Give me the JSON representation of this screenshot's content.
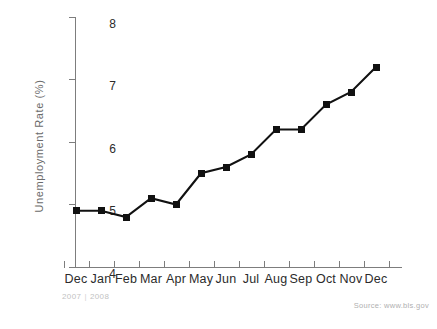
{
  "chart_data": {
    "type": "line",
    "title": "",
    "xlabel": "",
    "ylabel": "Unemployment Rate (%)",
    "categories": [
      "Dec",
      "Jan",
      "Feb",
      "Mar",
      "Apr",
      "May",
      "Jun",
      "Jul",
      "Aug",
      "Sep",
      "Oct",
      "Nov",
      "Dec"
    ],
    "values": [
      4.9,
      4.9,
      4.8,
      5.1,
      5.0,
      5.5,
      5.6,
      5.8,
      6.2,
      6.2,
      6.6,
      6.8,
      7.2
    ],
    "ylim": [
      4,
      8
    ],
    "yticks": [
      4,
      5,
      6,
      7,
      8
    ],
    "ytick_labels": [
      "4",
      "5",
      "6",
      "7",
      "8"
    ],
    "grid": false,
    "legend": "none",
    "marker": "square",
    "line_color": "#111111",
    "marker_color": "#111111",
    "axis_color": "#7d7d7d",
    "period_labels": [
      "2007",
      "2008"
    ],
    "period_separator": "|",
    "source": "Source: www.bls.gov"
  },
  "axis": {
    "y_title": "Unemployment Rate (%)",
    "y_ticks": [
      "8",
      "7",
      "6",
      "5",
      "4"
    ],
    "x_ticks": [
      "Dec",
      "Jan",
      "Feb",
      "Mar",
      "Apr",
      "May",
      "Jun",
      "Jul",
      "Aug",
      "Sep",
      "Oct",
      "Nov",
      "Dec"
    ]
  },
  "footer": {
    "year_start": "2007",
    "year_separator": "|",
    "year_end": "2008",
    "source": "Source: www.bls.gov"
  }
}
